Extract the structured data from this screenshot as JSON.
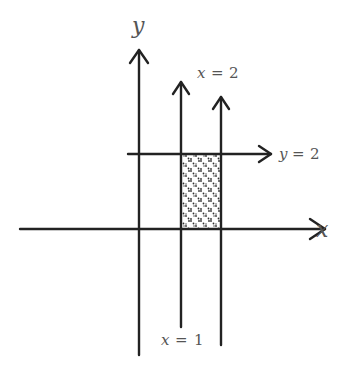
{
  "diagram": {
    "axes": {
      "x_label": "x",
      "y_label": "y"
    },
    "lines": [
      {
        "id": "x1",
        "label_var": "x",
        "label_eq": "=",
        "label_val": "1",
        "equation": "x = 1"
      },
      {
        "id": "x2",
        "label_var": "x",
        "label_eq": "=",
        "label_val": "2",
        "equation": "x = 2"
      },
      {
        "id": "y2",
        "label_var": "y",
        "label_eq": "=",
        "label_val": "2",
        "equation": "y = 2"
      }
    ],
    "shaded_region": {
      "description": "1 ≤ x ≤ 2, 0 ≤ y ≤ 2",
      "pattern": "dotted crosshatch"
    },
    "colors": {
      "line": "#222222",
      "text": "#555555",
      "shade": "#333333"
    }
  }
}
